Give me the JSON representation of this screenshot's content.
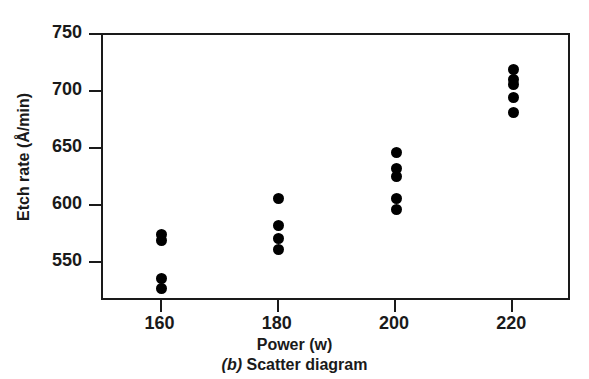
{
  "chart_data": {
    "type": "scatter",
    "title": "",
    "caption_letter": "(b)",
    "caption_text": " Scatter diagram",
    "xlabel": "Power (w)",
    "ylabel": "Etch rate (Å/min)",
    "xlim": [
      150,
      230
    ],
    "ylim": [
      516,
      750
    ],
    "xticks": [
      160,
      180,
      200,
      220
    ],
    "xticklabels": [
      "160",
      "180",
      "200",
      "220"
    ],
    "yticks": [
      550,
      600,
      650,
      700,
      750
    ],
    "yticklabels": [
      "550",
      "600",
      "650",
      "700",
      "750"
    ],
    "grid": false,
    "legend": false,
    "marker": "filled-circle",
    "marker_color": "#000000",
    "marker_size_px": 11,
    "x": [
      160,
      160,
      160,
      160,
      180,
      180,
      180,
      180,
      200,
      200,
      200,
      200,
      200,
      220,
      220,
      220,
      220,
      220
    ],
    "y": [
      575,
      570,
      537,
      528,
      607,
      583,
      572,
      562,
      647,
      633,
      626,
      607,
      597,
      720,
      711,
      707,
      695,
      682
    ],
    "points": [
      {
        "x": 160,
        "y": 575
      },
      {
        "x": 160,
        "y": 570
      },
      {
        "x": 160,
        "y": 537
      },
      {
        "x": 160,
        "y": 528
      },
      {
        "x": 180,
        "y": 607
      },
      {
        "x": 180,
        "y": 583
      },
      {
        "x": 180,
        "y": 572
      },
      {
        "x": 180,
        "y": 562
      },
      {
        "x": 200,
        "y": 647
      },
      {
        "x": 200,
        "y": 633
      },
      {
        "x": 200,
        "y": 626
      },
      {
        "x": 200,
        "y": 607
      },
      {
        "x": 200,
        "y": 597
      },
      {
        "x": 220,
        "y": 720
      },
      {
        "x": 220,
        "y": 711
      },
      {
        "x": 220,
        "y": 707
      },
      {
        "x": 220,
        "y": 695
      },
      {
        "x": 220,
        "y": 682
      }
    ],
    "groups": [
      {
        "power": 160,
        "values": [
          575,
          570,
          537,
          528
        ]
      },
      {
        "power": 180,
        "values": [
          607,
          583,
          572,
          562
        ]
      },
      {
        "power": 200,
        "values": [
          647,
          633,
          626,
          607,
          597
        ]
      },
      {
        "power": 220,
        "values": [
          720,
          711,
          707,
          695,
          682
        ]
      }
    ],
    "axis_color": "#1a1a1a",
    "background": "#ffffff"
  }
}
